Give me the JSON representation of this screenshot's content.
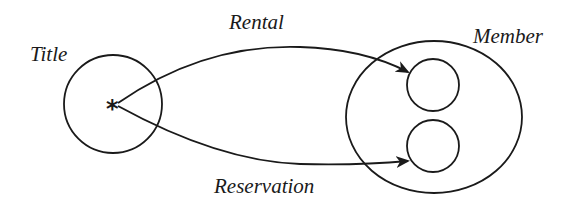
{
  "diagram": {
    "type": "mapping-diagram",
    "colors": {
      "ink": "#1a1a1a",
      "background": "#ffffff"
    },
    "nodes": {
      "title": {
        "label": "Title",
        "element_marker": "*"
      },
      "member": {
        "label": "Member",
        "inner_elements": 2
      }
    },
    "edges": [
      {
        "label": "Rental",
        "from": "Title.*",
        "to": "Member.element-1"
      },
      {
        "label": "Reservation",
        "from": "Title.*",
        "to": "Member.element-2"
      }
    ]
  }
}
